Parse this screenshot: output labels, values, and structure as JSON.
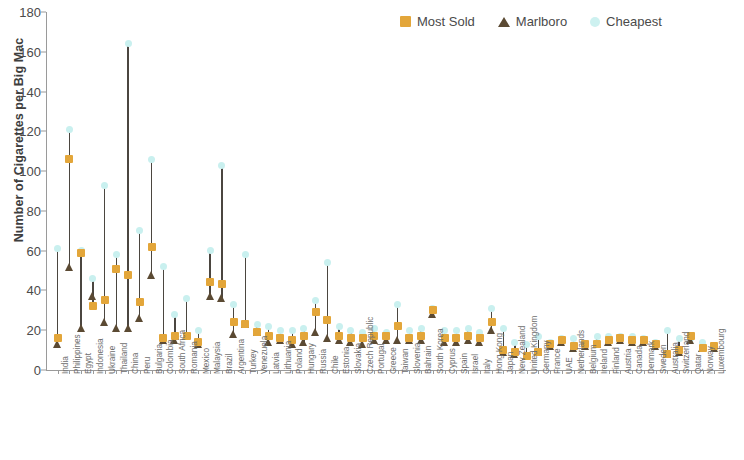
{
  "chart_data": {
    "type": "scatter",
    "title": "",
    "xlabel": "",
    "ylabel": "Number of Cigarettes per Big Mac",
    "ylim": [
      0,
      180
    ],
    "yticks": [
      0,
      20,
      40,
      60,
      80,
      100,
      120,
      140,
      160,
      180
    ],
    "grid": false,
    "legend_position": "top-right",
    "legend": [
      "Most Sold",
      "Marlboro",
      "Cheapest"
    ],
    "series_colors": {
      "most_sold": "#e3a63a",
      "marlboro": "#5b4a33",
      "cheapest": "#cdf1f0",
      "stem": "#4b4640"
    },
    "categories": [
      "India",
      "Philippines",
      "Egypt",
      "Indonesia",
      "Ukraine",
      "Thailand",
      "China",
      "Peru",
      "Bulgaria",
      "Colombia",
      "South Africa",
      "Romania",
      "Mexico",
      "Malaysia",
      "Brazil",
      "Argentina",
      "Turkey",
      "Venezuela",
      "Latvia",
      "Lithuania",
      "Poland",
      "Hungary",
      "Russia",
      "Chile",
      "Estonia",
      "Slovakia",
      "Czech Republic",
      "Portugal",
      "Greece",
      "Taiwan",
      "Slovenia",
      "Bahrain",
      "South Korea",
      "Cyprus",
      "Spain",
      "Israel",
      "Italy",
      "Hong Kong",
      "Japan",
      "New Zealand",
      "United Kingdom",
      "Germany",
      "France",
      "UAE",
      "Netherlands",
      "Belgium",
      "Ireland",
      "Finland",
      "Austria",
      "Canada",
      "Denmark",
      "Sweden",
      "Australia",
      "Switzerland",
      "Qatar",
      "Norway",
      "Luxembourg"
    ],
    "series": [
      {
        "name": "Cheapest",
        "values": [
          61,
          121,
          60,
          46,
          93,
          58,
          164,
          70,
          106,
          52,
          28,
          36,
          20,
          60,
          103,
          33,
          58,
          23,
          22,
          20,
          20,
          21,
          35,
          54,
          22,
          20,
          19,
          21,
          19,
          33,
          20,
          21,
          31,
          20,
          20,
          21,
          19,
          31,
          21,
          14,
          13,
          17,
          14,
          16,
          16,
          13,
          17,
          17,
          17,
          17,
          16,
          14,
          20,
          16,
          16,
          14,
          12
        ]
      },
      {
        "name": "Most Sold",
        "values": [
          16,
          106,
          59,
          32,
          35,
          51,
          48,
          34,
          62,
          16,
          17,
          17,
          14,
          44,
          43,
          24,
          23,
          19,
          17,
          16,
          15,
          17,
          29,
          25,
          17,
          16,
          16,
          17,
          17,
          22,
          16,
          17,
          30,
          16,
          16,
          17,
          16,
          24,
          10,
          9,
          7,
          9,
          13,
          15,
          12,
          13,
          13,
          15,
          16,
          15,
          15,
          13,
          8,
          10,
          17,
          11,
          12
        ]
      },
      {
        "name": "Marlboro",
        "values": [
          13,
          52,
          21,
          37,
          24,
          21,
          21,
          26,
          48,
          15,
          15,
          17,
          13,
          37,
          36,
          18,
          23,
          19,
          14,
          15,
          13,
          14,
          19,
          16,
          15,
          14,
          13,
          15,
          15,
          15,
          15,
          15,
          28,
          14,
          14,
          15,
          14,
          20,
          9,
          8,
          7,
          9,
          12,
          14,
          11,
          12,
          13,
          14,
          15,
          14,
          14,
          12,
          8,
          9,
          15,
          11,
          11
        ]
      }
    ]
  }
}
